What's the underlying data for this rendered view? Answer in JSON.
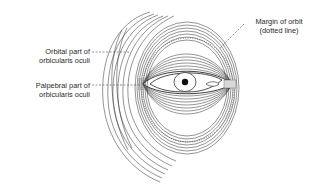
{
  "figure": {
    "labels": {
      "orbital_part": {
        "line1": "Orbital part of",
        "line2": "orbicularis oculi"
      },
      "palpebral_part": {
        "line1": "Palpebral part of",
        "line2": "orbicularis oculi"
      },
      "margin_of_orbit": {
        "line1": "Margin of orbit",
        "line2": "(dotted line)"
      }
    },
    "colors": {
      "line": "#2a2a2a",
      "background": "#ffffff"
    }
  }
}
